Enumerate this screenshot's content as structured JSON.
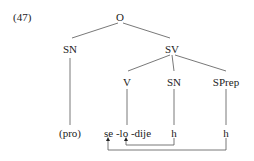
{
  "example_number": "(47)",
  "tree": {
    "root": "O",
    "subject": "SN",
    "vp": "SV",
    "verb": "V",
    "object": "SN",
    "pp": "SPrep"
  },
  "terminals": {
    "pro": "(pro)",
    "verb_string": "se -lo -dije",
    "object_trace": "h",
    "pp_trace": "h"
  },
  "colors": {
    "line": "#444444",
    "text": "#222222",
    "background": "#ffffff"
  }
}
